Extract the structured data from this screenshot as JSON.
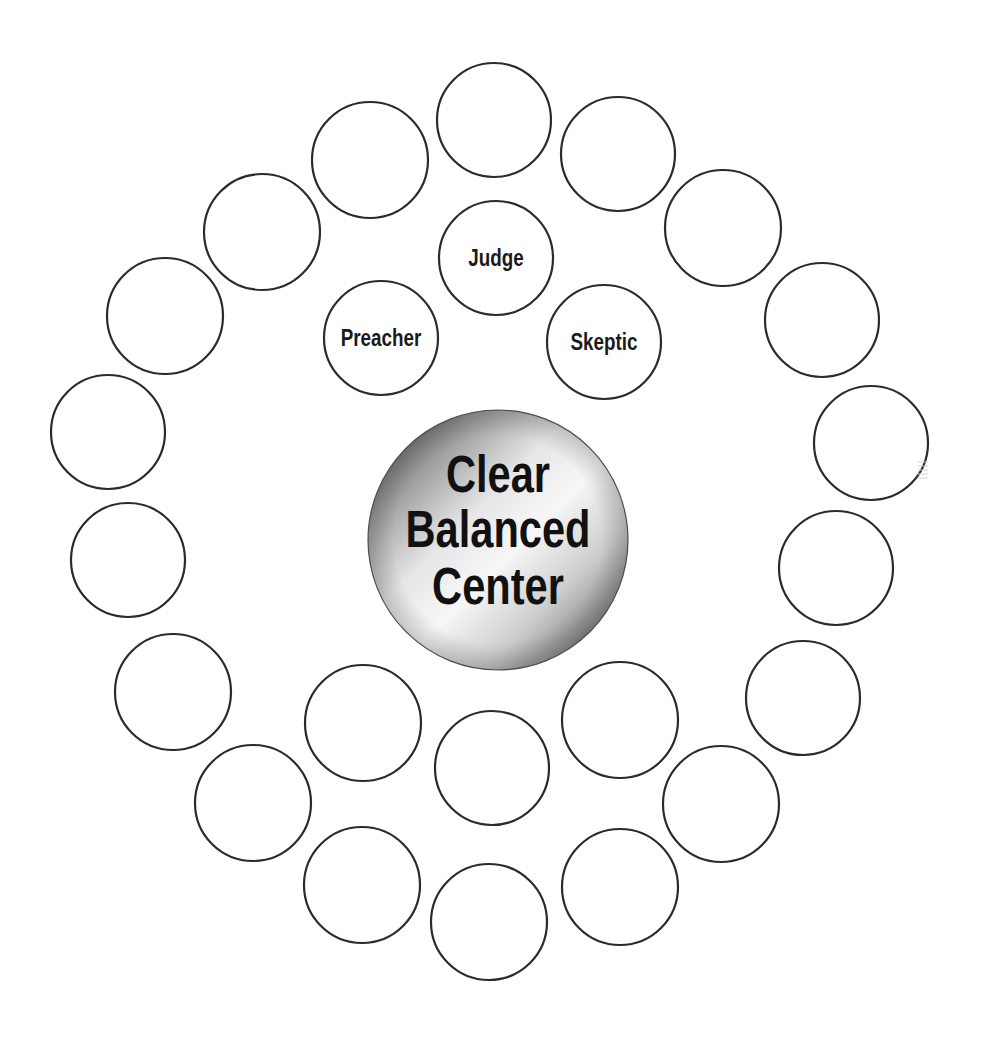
{
  "diagram": {
    "center": {
      "lines": [
        "Clear",
        "Balanced",
        "Center"
      ],
      "cx": 498,
      "cy": 540,
      "r": 130,
      "gradient_colors": [
        "#4a4a4a",
        "#9a9a9a",
        "#e8e8e8",
        "#f7f7f7",
        "#d0d0d0",
        "#8a8a8a",
        "#4a4a4a"
      ]
    },
    "inner_roles": [
      {
        "label": "Judge",
        "cx": 496,
        "cy": 258,
        "r": 57
      },
      {
        "label": "Preacher",
        "cx": 381,
        "cy": 338,
        "r": 57
      },
      {
        "label": "Skeptic",
        "cx": 604,
        "cy": 342,
        "r": 57
      }
    ],
    "empty_circles": [
      {
        "cx": 494,
        "cy": 120,
        "r": 57
      },
      {
        "cx": 618,
        "cy": 154,
        "r": 57
      },
      {
        "cx": 723,
        "cy": 228,
        "r": 58
      },
      {
        "cx": 822,
        "cy": 320,
        "r": 57
      },
      {
        "cx": 871,
        "cy": 443,
        "r": 57
      },
      {
        "cx": 836,
        "cy": 568,
        "r": 57
      },
      {
        "cx": 803,
        "cy": 698,
        "r": 57
      },
      {
        "cx": 721,
        "cy": 804,
        "r": 58
      },
      {
        "cx": 620,
        "cy": 887,
        "r": 58
      },
      {
        "cx": 489,
        "cy": 922,
        "r": 58
      },
      {
        "cx": 362,
        "cy": 885,
        "r": 58
      },
      {
        "cx": 253,
        "cy": 803,
        "r": 58
      },
      {
        "cx": 173,
        "cy": 692,
        "r": 58
      },
      {
        "cx": 128,
        "cy": 560,
        "r": 57
      },
      {
        "cx": 108,
        "cy": 432,
        "r": 57
      },
      {
        "cx": 165,
        "cy": 316,
        "r": 58
      },
      {
        "cx": 262,
        "cy": 232,
        "r": 58
      },
      {
        "cx": 370,
        "cy": 160,
        "r": 58
      },
      {
        "cx": 363,
        "cy": 723,
        "r": 58
      },
      {
        "cx": 492,
        "cy": 768,
        "r": 57
      },
      {
        "cx": 620,
        "cy": 720,
        "r": 58
      }
    ],
    "stroke_color": "#2b2b2b"
  }
}
